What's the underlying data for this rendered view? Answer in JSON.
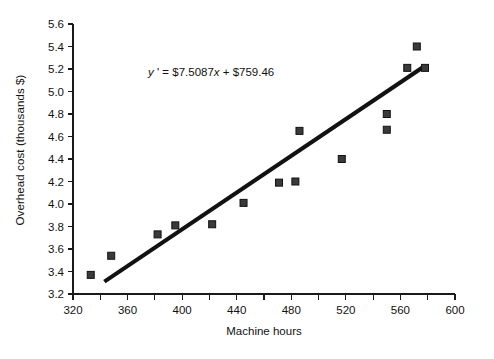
{
  "chart_data": {
    "type": "scatter",
    "title": "",
    "xlabel": "Machine hours",
    "ylabel": "Overhead cost (thousands $)",
    "xlim": [
      320,
      600
    ],
    "ylim": [
      3.2,
      5.6
    ],
    "xticks": [
      320,
      360,
      400,
      440,
      480,
      520,
      560,
      600
    ],
    "xtick_labels": [
      "320",
      "360",
      "400",
      "440",
      "480",
      "520",
      "560",
      "600"
    ],
    "xminor_ticks": [
      340,
      380,
      420,
      460,
      500,
      540,
      580
    ],
    "yticks": [
      3.2,
      3.4,
      3.6,
      3.8,
      4.0,
      4.2,
      4.4,
      4.6,
      4.8,
      5.0,
      5.2,
      5.4,
      5.6
    ],
    "ytick_labels": [
      "3.2",
      "3.4",
      "3.6",
      "3.8",
      "4.0",
      "4.2",
      "4.4",
      "4.6",
      "4.8",
      "5.0",
      "5.2",
      "5.4",
      "5.6"
    ],
    "grid": false,
    "legend": false,
    "marker": "square",
    "points": [
      {
        "x": 333,
        "y": 3.37
      },
      {
        "x": 348,
        "y": 3.54
      },
      {
        "x": 382,
        "y": 3.73
      },
      {
        "x": 395,
        "y": 3.81
      },
      {
        "x": 422,
        "y": 3.82
      },
      {
        "x": 445,
        "y": 4.01
      },
      {
        "x": 471,
        "y": 4.19
      },
      {
        "x": 483,
        "y": 4.2
      },
      {
        "x": 486,
        "y": 4.65
      },
      {
        "x": 517,
        "y": 4.4
      },
      {
        "x": 550,
        "y": 4.8
      },
      {
        "x": 550,
        "y": 4.66
      },
      {
        "x": 565,
        "y": 5.21
      },
      {
        "x": 572,
        "y": 5.4
      },
      {
        "x": 578,
        "y": 5.21
      }
    ],
    "trendline": {
      "equation_parts": {
        "y_symbol": "y",
        "prime": " '",
        "equals": " = ",
        "slope_term": "$7.5087",
        "x_symbol": "x",
        "plus": " + ",
        "intercept": "$759.46"
      },
      "equation_text": "y ' = $7.5087x + $759.46",
      "slope": 7.5087,
      "intercept": 759.46,
      "units_note": "y in dollars; plotted in thousands",
      "x_start": 343,
      "y_start": 3.31,
      "x_end": 577,
      "y_end": 5.22
    }
  }
}
